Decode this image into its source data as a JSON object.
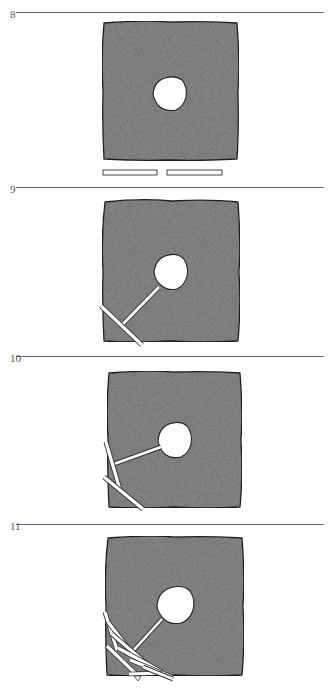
{
  "figure": {
    "top_cutoff_text": "…………",
    "colors": {
      "square_fill": "#8a8a8a",
      "square_outline": "#222222",
      "hole_fill": "#ffffff",
      "stick_fill": "#ffffff",
      "stick_outline": "#333333",
      "rule_color": "#666666"
    },
    "panels": [
      {
        "number": "8",
        "rule_y": 12,
        "square": {
          "x": 103,
          "y": 22,
          "w": 135,
          "h": 138
        },
        "hole": {
          "cx": 170,
          "cy": 93,
          "r": 17
        },
        "sticks_description": "two loose sticks lying below the square"
      },
      {
        "number": "9",
        "rule_y": 187,
        "square": {
          "x": 103,
          "y": 200,
          "w": 137,
          "h": 142
        },
        "hole": {
          "cx": 170,
          "cy": 271,
          "r": 17
        },
        "sticks_description": "one stick reaching from hole to edge, crossed by a second stick"
      },
      {
        "number": "10",
        "rule_y": 356,
        "square": {
          "x": 108,
          "y": 372,
          "w": 134,
          "h": 136
        },
        "hole": {
          "cx": 174,
          "cy": 440,
          "r": 17
        },
        "sticks_description": "three sticks forming a chain from hole to lower-left corner"
      },
      {
        "number": "11",
        "rule_y": 524,
        "square": {
          "x": 106,
          "y": 537,
          "w": 138,
          "h": 139
        },
        "hole": {
          "cx": 176,
          "cy": 605,
          "r": 18
        },
        "sticks_description": "many sticks piled in the lower-left corner with one reaching the hole"
      }
    ]
  }
}
